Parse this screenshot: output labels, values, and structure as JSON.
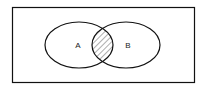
{
  "diagram": {
    "type": "venn",
    "universe": {
      "label": ""
    },
    "sets": [
      {
        "id": "A",
        "label": "A"
      },
      {
        "id": "B",
        "label": "B"
      }
    ],
    "highlighted_region": "A ∩ B",
    "highlight_style": "diagonal-hatch",
    "colors": {
      "stroke": "#111111",
      "background": "#ffffff",
      "hatch": "#333333"
    }
  }
}
